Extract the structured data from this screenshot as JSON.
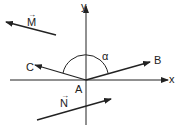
{
  "diagram": {
    "axes": {
      "x_label": "x",
      "y_label": "y",
      "origin_label": "A"
    },
    "points": {
      "B": "B",
      "C": "C"
    },
    "angle_label": "α",
    "vectors": {
      "M": "M",
      "N": "N"
    },
    "arrow_glyph": "→",
    "colors": {
      "stroke": "#222222",
      "background": "#ffffff"
    }
  }
}
